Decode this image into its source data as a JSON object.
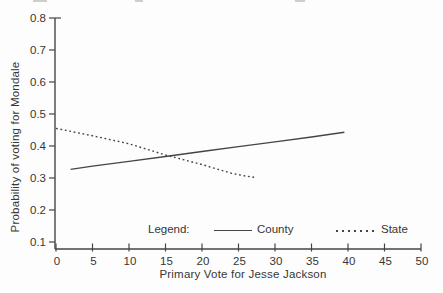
{
  "chart_data": {
    "type": "line",
    "title": "",
    "xlabel": "Primary Vote for Jesse Jackson",
    "ylabel": "Probability of voting for Mondale",
    "xlim": [
      0,
      50
    ],
    "ylim": [
      0.1,
      0.8
    ],
    "xticks": [
      0,
      5,
      10,
      15,
      20,
      25,
      30,
      35,
      40,
      45,
      50
    ],
    "yticks": [
      0.1,
      0.2,
      0.3,
      0.4,
      0.5,
      0.6,
      0.7,
      0.8
    ],
    "grid": false,
    "legend_label": "Legend:",
    "legend_position": "inside-bottom",
    "line_color": "#454545",
    "text_color": "#363636",
    "series": [
      {
        "name": "County",
        "style": "solid",
        "x": [
          2,
          5,
          10,
          15,
          20,
          25,
          30,
          35,
          39.5
        ],
        "y": [
          0.327,
          0.337,
          0.352,
          0.367,
          0.383,
          0.398,
          0.413,
          0.428,
          0.443
        ]
      },
      {
        "name": "State",
        "style": "dashed",
        "x": [
          0,
          5,
          10,
          15,
          20,
          24,
          26,
          27.5
        ],
        "y": [
          0.455,
          0.432,
          0.407,
          0.372,
          0.342,
          0.315,
          0.306,
          0.301
        ]
      }
    ]
  }
}
